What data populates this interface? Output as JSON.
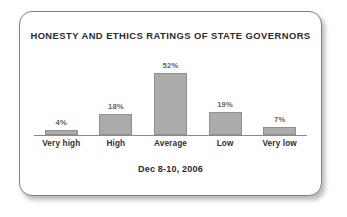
{
  "chart_data": {
    "type": "bar",
    "title": "HONESTY AND ETHICS RATINGS OF STATE GOVERNORS",
    "subtitle": "Dec 8-10, 2006",
    "xlabel": "",
    "ylabel": "",
    "ylim": [
      0,
      60
    ],
    "grid": false,
    "legend": "none",
    "categories": [
      "Very high",
      "High",
      "Average",
      "Low",
      "Very low"
    ],
    "values": [
      4,
      18,
      52,
      19,
      7
    ],
    "value_labels": [
      "4%",
      "18%",
      "52%",
      "19%",
      "7%"
    ],
    "bar_color": "#ababab",
    "bar_border_color": "#909090",
    "axis_color": "#8a8a8a",
    "title_color": "#2b2b2b",
    "label_color": "#2f2f2f",
    "value_label_color": "#636363"
  }
}
